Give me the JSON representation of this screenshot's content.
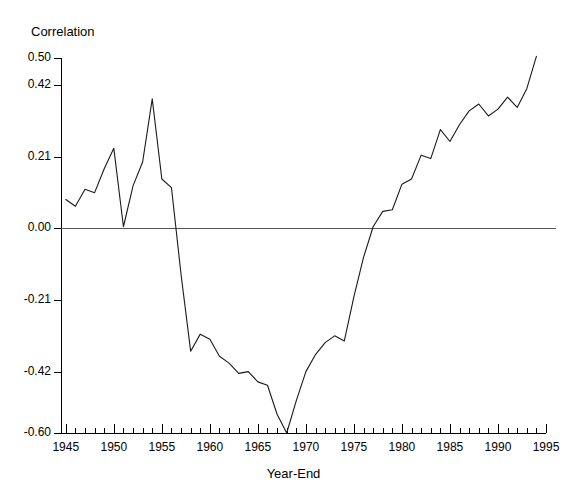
{
  "chart_data": {
    "type": "line",
    "title": "",
    "ylabel": "Correlation",
    "xlabel": "Year-End",
    "xlim": [
      1944.5,
      1995.0
    ],
    "ylim": [
      -0.6,
      0.5
    ],
    "grid": false,
    "legend": null,
    "y_ticks": [
      {
        "value": 0.5,
        "label": "0.50"
      },
      {
        "value": 0.42,
        "label": "0.42"
      },
      {
        "value": 0.21,
        "label": "0.21"
      },
      {
        "value": 0.0,
        "label": "0.00"
      },
      {
        "value": -0.21,
        "label": "-0.21"
      },
      {
        "value": -0.42,
        "label": "-0.42"
      },
      {
        "value": -0.6,
        "label": "-0.60"
      }
    ],
    "x_ticks_major": [
      {
        "value": 1945,
        "label": "1945"
      },
      {
        "value": 1950,
        "label": "1950"
      },
      {
        "value": 1955,
        "label": "1955"
      },
      {
        "value": 1960,
        "label": "1960"
      },
      {
        "value": 1965,
        "label": "1965"
      },
      {
        "value": 1970,
        "label": "1970"
      },
      {
        "value": 1975,
        "label": "1975"
      },
      {
        "value": 1980,
        "label": "1980"
      },
      {
        "value": 1985,
        "label": "1985"
      },
      {
        "value": 1990,
        "label": "1990"
      },
      {
        "value": 1995,
        "label": "1995"
      }
    ],
    "x_minor_tick_step": 1,
    "zero_line": 0.0,
    "series": [
      {
        "name": "Correlation",
        "color": "#1a1a1a",
        "x": [
          1945,
          1946,
          1947,
          1948,
          1949,
          1950,
          1951,
          1952,
          1953,
          1954,
          1955,
          1956,
          1957,
          1958,
          1959,
          1960,
          1961,
          1962,
          1963,
          1964,
          1965,
          1966,
          1967,
          1968,
          1969,
          1970,
          1971,
          1972,
          1973,
          1974,
          1975,
          1976,
          1977,
          1978,
          1979,
          1980,
          1981,
          1982,
          1983,
          1984,
          1985,
          1986,
          1987,
          1988,
          1989,
          1990,
          1991,
          1992,
          1993,
          1994
        ],
        "values": [
          0.085,
          0.065,
          0.115,
          0.105,
          0.175,
          0.235,
          0.005,
          0.125,
          0.195,
          0.38,
          0.145,
          0.12,
          -0.135,
          -0.36,
          -0.31,
          -0.325,
          -0.375,
          -0.395,
          -0.425,
          -0.42,
          -0.45,
          -0.46,
          -0.545,
          -0.6,
          -0.505,
          -0.42,
          -0.37,
          -0.335,
          -0.315,
          -0.33,
          -0.2,
          -0.085,
          0.005,
          0.05,
          0.055,
          0.13,
          0.145,
          0.215,
          0.205,
          0.29,
          0.255,
          0.305,
          0.345,
          0.365,
          0.33,
          0.35,
          0.385,
          0.355,
          0.41,
          0.505
        ]
      }
    ]
  },
  "plot_geometry": {
    "x_pixel_left": 61,
    "x_pixel_right": 546,
    "y_pixel_top": 58,
    "y_pixel_bottom": 433,
    "zero_line_right": 556
  }
}
